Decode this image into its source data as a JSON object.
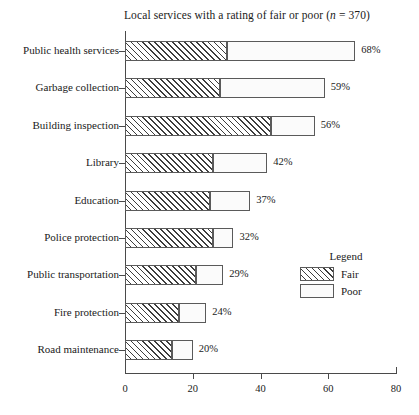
{
  "chart_data": {
    "type": "bar",
    "orientation": "horizontal",
    "stacked": true,
    "title": "Local services with a rating of fair or poor (n = 370)",
    "title_prefix": "Local services with a rating of fair or poor (",
    "title_italic": "n",
    "title_suffix": " = 370)",
    "sample_size": 370,
    "xlabel": "",
    "ylabel": "",
    "xlim": [
      0,
      80
    ],
    "xticks": [
      0,
      20,
      40,
      60,
      80
    ],
    "xtick_labels": [
      "0",
      "20",
      "40",
      "60",
      "80"
    ],
    "grid": false,
    "legend_position": "right-middle",
    "categories": [
      "Public health services",
      "Garbage collection",
      "Building inspection",
      "Library",
      "Education",
      "Police protection",
      "Public transportation",
      "Fire protection",
      "Road maintenance"
    ],
    "series": [
      {
        "name": "Fair",
        "pattern": "diagonal-hatch",
        "values": [
          30,
          28,
          43,
          26,
          25,
          26,
          21,
          16,
          14
        ]
      },
      {
        "name": "Poor",
        "pattern": "dotted",
        "values": [
          38,
          31,
          13,
          16,
          12,
          6,
          8,
          8,
          6
        ]
      }
    ],
    "totals": [
      68,
      59,
      56,
      42,
      37,
      32,
      29,
      24,
      20
    ],
    "total_labels": [
      "68%",
      "59%",
      "56%",
      "42%",
      "37%",
      "32%",
      "29%",
      "24%",
      "20%"
    ]
  },
  "legend": {
    "title": "Legend",
    "items": [
      {
        "label": "Fair",
        "pattern": "diagonal-hatch"
      },
      {
        "label": "Poor",
        "pattern": "dotted"
      }
    ]
  },
  "colors": {
    "background": "#ffffff",
    "axis": "#4a4a4a",
    "bar_border": "#5a5a5a",
    "hatch": "#3d3d3d",
    "dot": "#9a9a9a",
    "text": "#1a1a1a"
  }
}
